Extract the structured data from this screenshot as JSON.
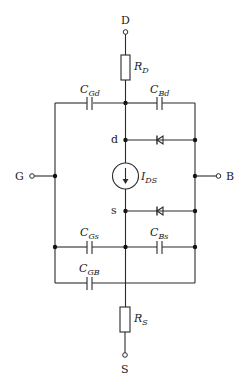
{
  "terminals": {
    "drain": "D",
    "source": "S",
    "gate": "G",
    "bulk": "B"
  },
  "internal_nodes": {
    "drain": "d",
    "source": "s"
  },
  "resistors": {
    "drain": {
      "main": "R",
      "sub": "D"
    },
    "source": {
      "main": "R",
      "sub": "S"
    }
  },
  "capacitors": {
    "gd": {
      "main": "C",
      "sub": "Gd"
    },
    "bd": {
      "main": "C",
      "sub": "Bd"
    },
    "gs": {
      "main": "C",
      "sub": "Gs"
    },
    "bs": {
      "main": "C",
      "sub": "Bs"
    },
    "gb": {
      "main": "C",
      "sub": "GB"
    }
  },
  "current_source": {
    "main": "I",
    "sub": "DS"
  },
  "diodes": [
    "bulk-drain diode",
    "bulk-source diode"
  ],
  "colors": {
    "line": "#2a2a2a",
    "background": "#ffffff"
  }
}
